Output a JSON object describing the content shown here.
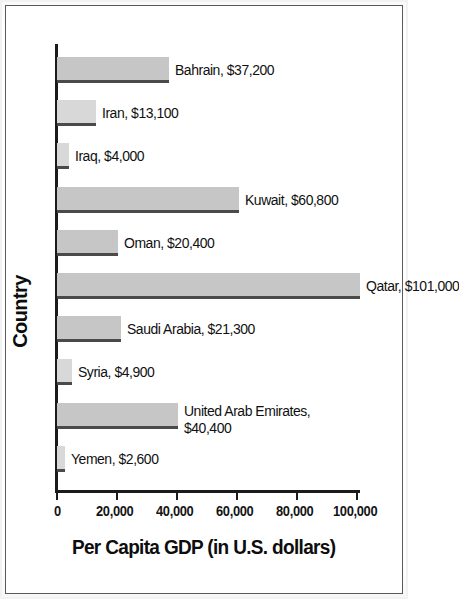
{
  "chart_data": {
    "type": "bar",
    "orientation": "horizontal",
    "title": "",
    "xlabel": "Per Capita GDP (in U.S. dollars)",
    "ylabel": "Country",
    "xlim": [
      0,
      101000
    ],
    "x_ticks": [
      0,
      20000,
      40000,
      60000,
      80000,
      100000
    ],
    "x_tick_labels": [
      "0",
      "20,000",
      "40,000",
      "60,000",
      "80,000",
      "100,000"
    ],
    "grid": false,
    "legend": false,
    "categories": [
      "Bahrain",
      "Iran",
      "Iraq",
      "Kuwait",
      "Oman",
      "Qatar",
      "Saudi Arabia",
      "Syria",
      "United Arab Emirates",
      "Yemen"
    ],
    "values": [
      37200,
      13100,
      4000,
      60800,
      20400,
      101000,
      21300,
      4900,
      40400,
      2600
    ],
    "value_labels": [
      "$37,200",
      "$13,100",
      "$4,000",
      "$60,800",
      "$20,400",
      "$101,000",
      "$21,300",
      "$4,900",
      "$40,400",
      "$2,600"
    ],
    "bars": [
      {
        "category": "Bahrain",
        "value": 37200,
        "label": "Bahrain, $37,200",
        "label_line2": ""
      },
      {
        "category": "Iran",
        "value": 13100,
        "label": "Iran, $13,100",
        "label_line2": ""
      },
      {
        "category": "Iraq",
        "value": 4000,
        "label": "Iraq, $4,000",
        "label_line2": ""
      },
      {
        "category": "Kuwait",
        "value": 60800,
        "label": "Kuwait, $60,800",
        "label_line2": ""
      },
      {
        "category": "Oman",
        "value": 20400,
        "label": "Oman, $20,400",
        "label_line2": ""
      },
      {
        "category": "Qatar",
        "value": 101000,
        "label": "Qatar, $101,000",
        "label_line2": ""
      },
      {
        "category": "Saudi Arabia",
        "value": 21300,
        "label": "Saudi Arabia, $21,300",
        "label_line2": ""
      },
      {
        "category": "Syria",
        "value": 4900,
        "label": "Syria, $4,900",
        "label_line2": ""
      },
      {
        "category": "United Arab Emirates",
        "value": 40400,
        "label": "United Arab Emirates,",
        "label_line2": "$40,400"
      },
      {
        "category": "Yemen",
        "value": 2600,
        "label": "Yemen, $2,600",
        "label_line2": ""
      }
    ],
    "colors": {
      "bar_fill": "#c6c6c6",
      "bar_shadow": "#4a4a4a",
      "axis": "#1b1b1b",
      "text": "#101010",
      "background": "#ffffff",
      "frame": "#5a5a5a"
    }
  },
  "axis": {
    "x_title": "Per Capita GDP (in U.S. dollars)",
    "y_title": "Country",
    "ticks": [
      {
        "value": 0,
        "label": "0"
      },
      {
        "value": 20000,
        "label": "20,000"
      },
      {
        "value": 40000,
        "label": "40,000"
      },
      {
        "value": 60000,
        "label": "60,000"
      },
      {
        "value": 80000,
        "label": "80,000"
      },
      {
        "value": 100000,
        "label": "100,000"
      }
    ]
  }
}
